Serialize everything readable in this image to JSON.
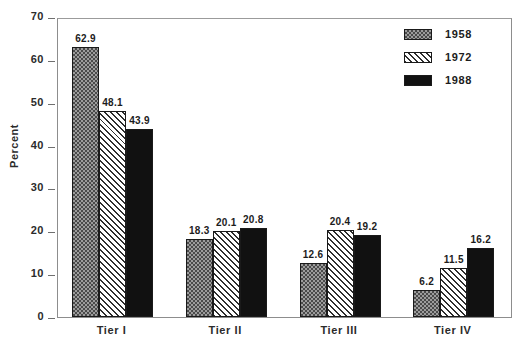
{
  "chart_data": {
    "type": "bar",
    "title": "",
    "xlabel": "",
    "ylabel": "Percent",
    "ylim": [
      0,
      70
    ],
    "ytick_step": 10,
    "yticks": [
      "0",
      "10",
      "20",
      "30",
      "40",
      "50",
      "60",
      "70"
    ],
    "grid": false,
    "legend_position": "top-right",
    "categories": [
      "Tier I",
      "Tier II",
      "Tier III",
      "Tier IV"
    ],
    "series": [
      {
        "name": "1958",
        "pattern": "checker",
        "color": "#9c9c9c",
        "values": [
          62.9,
          18.3,
          12.6,
          6.2
        ],
        "labels": [
          "62.9",
          "18.3",
          "12.6",
          "6.2"
        ]
      },
      {
        "name": "1972",
        "pattern": "hatch",
        "color": "#ffffff",
        "values": [
          48.1,
          20.1,
          20.4,
          11.5
        ],
        "labels": [
          "48.1",
          "20.1",
          "20.4",
          "11.5"
        ]
      },
      {
        "name": "1988",
        "pattern": "solid",
        "color": "#111111",
        "values": [
          43.9,
          20.8,
          19.2,
          16.2
        ],
        "labels": [
          "43.9",
          "20.8",
          "19.2",
          "16.2"
        ]
      }
    ]
  },
  "axis": {
    "ylabel": "Percent",
    "yticks": [
      "70",
      "60",
      "50",
      "40",
      "30",
      "20",
      "10",
      "0"
    ],
    "xticks": [
      "Tier I",
      "Tier II",
      "Tier III",
      "Tier IV"
    ]
  },
  "legend": {
    "items": [
      {
        "label": "1958"
      },
      {
        "label": "1972"
      },
      {
        "label": "1988"
      }
    ]
  },
  "bars": {
    "g0": {
      "v0": "62.9",
      "v1": "48.1",
      "v2": "43.9"
    },
    "g1": {
      "v0": "18.3",
      "v1": "20.1",
      "v2": "20.8"
    },
    "g2": {
      "v0": "12.6",
      "v1": "20.4",
      "v2": "19.2"
    },
    "g3": {
      "v0": "6.2",
      "v1": "11.5",
      "v2": "16.2"
    }
  },
  "caption": {
    "remnant": ""
  }
}
